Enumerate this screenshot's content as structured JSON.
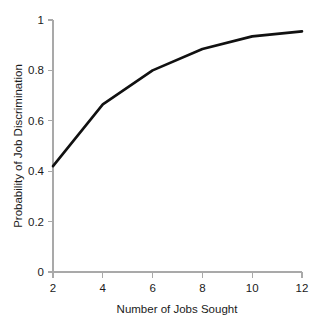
{
  "chart_data": {
    "type": "line",
    "title": "",
    "xlabel": "Number of Jobs Sought",
    "ylabel": "Probability of Job Discrimination",
    "x": [
      2,
      4,
      6,
      8,
      10,
      12
    ],
    "values": [
      0.42,
      0.665,
      0.8,
      0.885,
      0.935,
      0.955
    ],
    "series": [
      {
        "name": "Probability of Job Discrimination",
        "values": [
          0.42,
          0.665,
          0.8,
          0.885,
          0.935,
          0.955
        ]
      }
    ],
    "xlim": [
      2,
      12
    ],
    "ylim": [
      0,
      1
    ],
    "xticks": [
      2,
      4,
      6,
      8,
      10,
      12
    ],
    "xtick_labels": [
      "2",
      "4",
      "6",
      "8",
      "10",
      "12"
    ],
    "yticks": [
      0,
      0.2,
      0.4,
      0.6,
      0.8,
      1
    ],
    "ytick_labels": [
      "0",
      "0.2",
      "0.4",
      "0.6",
      "0.8",
      "1"
    ],
    "grid": false,
    "legend": false,
    "legend_position": "none",
    "line_color": "#111111",
    "axis_color": "#a9a9a9",
    "background_color": "#ffffff"
  }
}
